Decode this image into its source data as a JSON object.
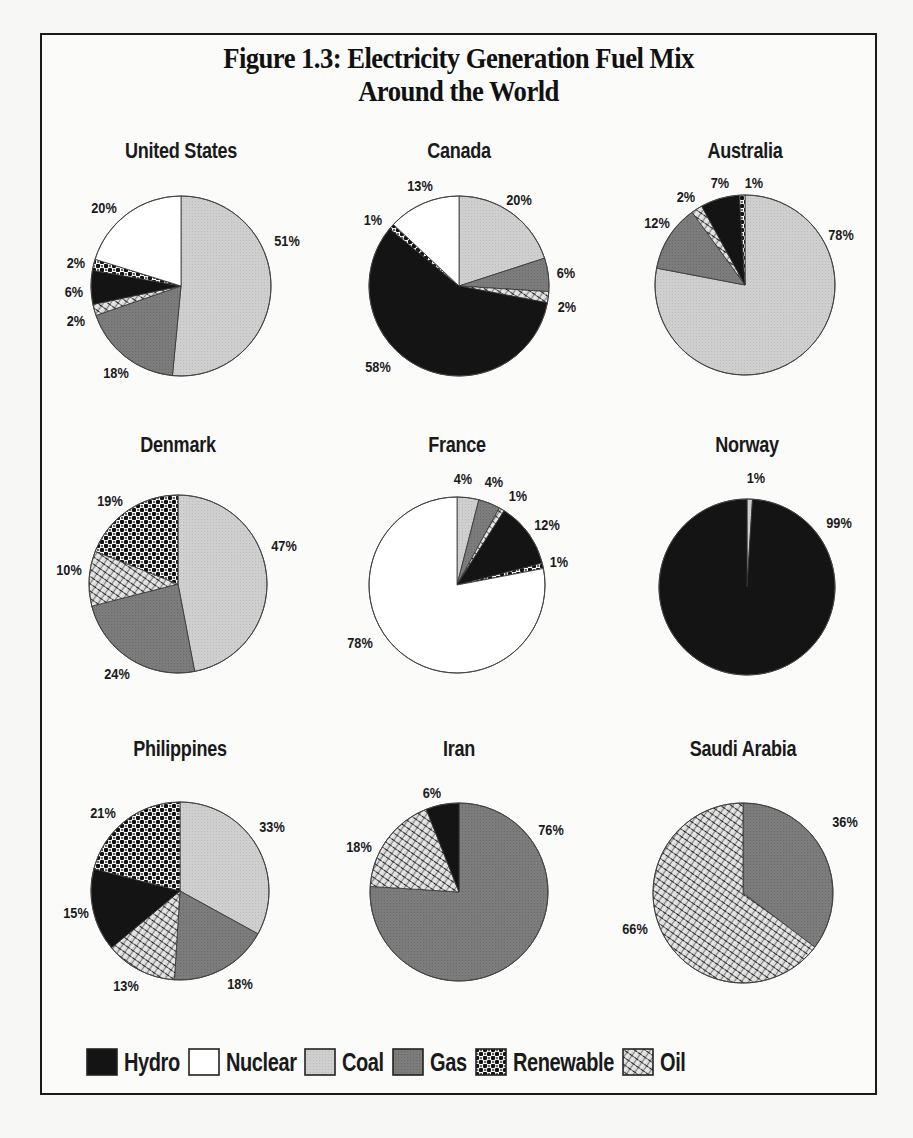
{
  "figure": {
    "title_line1": "Figure 1.3: Electricity Generation Fuel Mix",
    "title_line2": "Around the World"
  },
  "fuel_styles": {
    "Hydro": {
      "fill": "#141414",
      "pattern": "solid"
    },
    "Nuclear": {
      "fill": "#ffffff",
      "pattern": "solid"
    },
    "Coal": {
      "fill": "#cfcfcf",
      "pattern": "solid"
    },
    "Gas": {
      "fill": "#7c7c7c",
      "pattern": "solid"
    },
    "Renewable": {
      "fill": "#111111",
      "pattern": "checker"
    },
    "Oil": {
      "fill": "#9a9a9a",
      "pattern": "crosshatch"
    }
  },
  "legend": [
    {
      "label": "Hydro",
      "fuel": "Hydro"
    },
    {
      "label": "Nuclear",
      "fuel": "Nuclear"
    },
    {
      "label": "Coal",
      "fuel": "Coal"
    },
    {
      "label": "Gas",
      "fuel": "Gas"
    },
    {
      "label": "Renewable",
      "fuel": "Renewable"
    },
    {
      "label": "Oil",
      "fuel": "Oil"
    }
  ],
  "chart_data": [
    {
      "type": "pie",
      "title": "United States",
      "layout": {
        "cx": 181,
        "cy": 286,
        "r": 90,
        "title_y": 138
      },
      "slices": [
        {
          "label": "Coal",
          "value": 51,
          "text": "51%",
          "lx": 287,
          "ly": 240
        },
        {
          "label": "Gas",
          "value": 18,
          "text": "18%",
          "lx": 116,
          "ly": 372
        },
        {
          "label": "Oil",
          "value": 2,
          "text": "2%",
          "lx": 76,
          "ly": 320
        },
        {
          "label": "Hydro",
          "value": 6,
          "text": "6%",
          "lx": 74,
          "ly": 291
        },
        {
          "label": "Renewable",
          "value": 2,
          "text": "2%",
          "lx": 76,
          "ly": 262
        },
        {
          "label": "Nuclear",
          "value": 20,
          "text": "20%",
          "lx": 104,
          "ly": 207
        }
      ]
    },
    {
      "type": "pie",
      "title": "Canada",
      "layout": {
        "cx": 459,
        "cy": 286,
        "r": 90,
        "title_y": 138
      },
      "slices": [
        {
          "label": "Coal",
          "value": 20,
          "text": "20%",
          "lx": 519,
          "ly": 199
        },
        {
          "label": "Gas",
          "value": 6,
          "text": "6%",
          "lx": 566,
          "ly": 272
        },
        {
          "label": "Oil",
          "value": 2,
          "text": "2%",
          "lx": 567,
          "ly": 306
        },
        {
          "label": "Hydro",
          "value": 58,
          "text": "58%",
          "lx": 378,
          "ly": 366
        },
        {
          "label": "Renewable",
          "value": 1,
          "text": "1%",
          "lx": 373,
          "ly": 219
        },
        {
          "label": "Nuclear",
          "value": 13,
          "text": "13%",
          "lx": 420,
          "ly": 185
        }
      ]
    },
    {
      "type": "pie",
      "title": "Australia",
      "layout": {
        "cx": 745,
        "cy": 285,
        "r": 90,
        "title_y": 138
      },
      "slices": [
        {
          "label": "Coal",
          "value": 78,
          "text": "78%",
          "lx": 841,
          "ly": 234
        },
        {
          "label": "Gas",
          "value": 12,
          "text": "12%",
          "lx": 657,
          "ly": 222
        },
        {
          "label": "Oil",
          "value": 2,
          "text": "2%",
          "lx": 686,
          "ly": 196
        },
        {
          "label": "Hydro",
          "value": 7,
          "text": "7%",
          "lx": 720,
          "ly": 182
        },
        {
          "label": "Renewable",
          "value": 1,
          "text": "1%",
          "lx": 754,
          "ly": 182
        }
      ]
    },
    {
      "type": "pie",
      "title": "Denmark",
      "layout": {
        "cx": 178,
        "cy": 584,
        "r": 89,
        "title_y": 432
      },
      "slices": [
        {
          "label": "Coal",
          "value": 47,
          "text": "47%",
          "lx": 284,
          "ly": 545
        },
        {
          "label": "Gas",
          "value": 24,
          "text": "24%",
          "lx": 117,
          "ly": 673
        },
        {
          "label": "Oil",
          "value": 10,
          "text": "10%",
          "lx": 69,
          "ly": 569
        },
        {
          "label": "Renewable",
          "value": 19,
          "text": "19%",
          "lx": 110,
          "ly": 500
        }
      ]
    },
    {
      "type": "pie",
      "title": "France",
      "layout": {
        "cx": 457,
        "cy": 585,
        "r": 88,
        "title_y": 432
      },
      "slices": [
        {
          "label": "Coal",
          "value": 4,
          "text": "4%",
          "lx": 463,
          "ly": 478
        },
        {
          "label": "Gas",
          "value": 4,
          "text": "4%",
          "lx": 494,
          "ly": 481
        },
        {
          "label": "Oil",
          "value": 1,
          "text": "1%",
          "lx": 518,
          "ly": 495
        },
        {
          "label": "Hydro",
          "value": 12,
          "text": "12%",
          "lx": 547,
          "ly": 524
        },
        {
          "label": "Renewable",
          "value": 1,
          "text": "1%",
          "lx": 559,
          "ly": 561
        },
        {
          "label": "Nuclear",
          "value": 78,
          "text": "78%",
          "lx": 360,
          "ly": 642
        }
      ]
    },
    {
      "type": "pie",
      "title": "Norway",
      "layout": {
        "cx": 747,
        "cy": 587,
        "r": 88,
        "title_y": 432
      },
      "slices": [
        {
          "label": "Coal",
          "value": 1,
          "text": "1%",
          "lx": 756,
          "ly": 477
        },
        {
          "label": "Hydro",
          "value": 99,
          "text": "99%",
          "lx": 839,
          "ly": 522
        }
      ]
    },
    {
      "type": "pie",
      "title": "Philippines",
      "layout": {
        "cx": 180,
        "cy": 891,
        "r": 89,
        "title_y": 736
      },
      "slices": [
        {
          "label": "Coal",
          "value": 33,
          "text": "33%",
          "lx": 272,
          "ly": 826
        },
        {
          "label": "Gas",
          "value": 18,
          "text": "18%",
          "lx": 240,
          "ly": 983
        },
        {
          "label": "Oil",
          "value": 13,
          "text": "13%",
          "lx": 126,
          "ly": 985
        },
        {
          "label": "Hydro",
          "value": 15,
          "text": "15%",
          "lx": 76,
          "ly": 912
        },
        {
          "label": "Renewable",
          "value": 21,
          "text": "21%",
          "lx": 103,
          "ly": 812
        }
      ]
    },
    {
      "type": "pie",
      "title": "Iran",
      "layout": {
        "cx": 459,
        "cy": 892,
        "r": 89,
        "title_y": 736
      },
      "slices": [
        {
          "label": "Gas",
          "value": 76,
          "text": "76%",
          "lx": 551,
          "ly": 829
        },
        {
          "label": "Oil",
          "value": 18,
          "text": "18%",
          "lx": 359,
          "ly": 846
        },
        {
          "label": "Hydro",
          "value": 6,
          "text": "6%",
          "lx": 432,
          "ly": 792
        }
      ]
    },
    {
      "type": "pie",
      "title": "Saudi Arabia",
      "layout": {
        "cx": 743,
        "cy": 893,
        "r": 90,
        "title_y": 736
      },
      "slices": [
        {
          "label": "Gas",
          "value": 36,
          "text": "36%",
          "lx": 845,
          "ly": 821
        },
        {
          "label": "Oil",
          "value": 66,
          "text": "66%",
          "lx": 635,
          "ly": 928
        }
      ]
    }
  ]
}
